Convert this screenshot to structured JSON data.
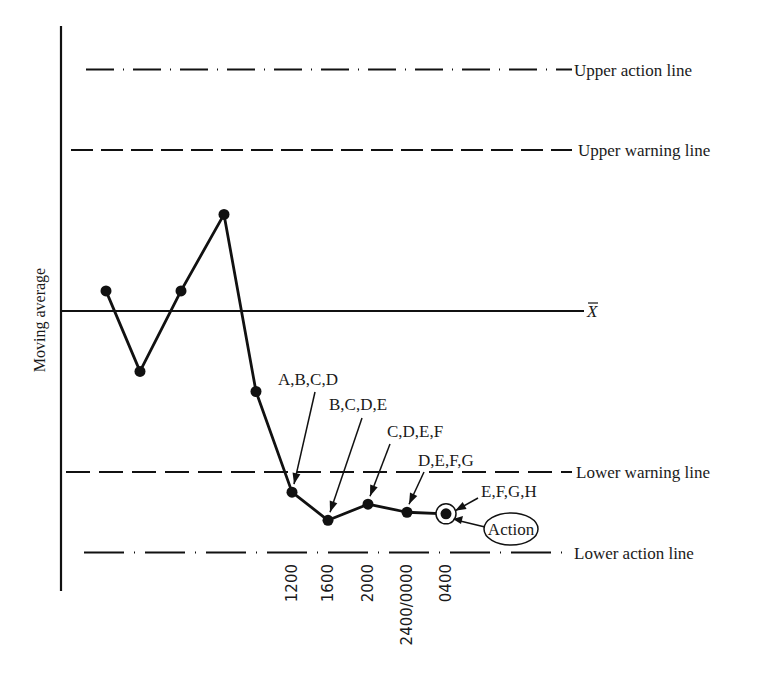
{
  "chart_data": {
    "type": "line",
    "title": "",
    "xlabel": "",
    "ylabel": "Moving average",
    "grid": false,
    "legend": "none",
    "ylim": [
      -3.3,
      3.3
    ],
    "x_tick_labels": [
      "1200",
      "1600",
      "2000",
      "2400/0000",
      "0400"
    ],
    "reference_lines": [
      {
        "name": "Upper action line",
        "value": 3.0,
        "style": "dash-dot"
      },
      {
        "name": "Upper warning line",
        "value": 2.0,
        "style": "dashed"
      },
      {
        "name": "X-bar",
        "label": "X",
        "overline": true,
        "value": 0.0,
        "style": "solid"
      },
      {
        "name": "Lower warning line",
        "value": -2.0,
        "style": "dashed"
      },
      {
        "name": "Lower action line",
        "value": -3.0,
        "style": "dash-dot"
      }
    ],
    "series": [
      {
        "name": "Moving average",
        "points": [
          {
            "x": 1,
            "y": 0.25
          },
          {
            "x": 2,
            "y": -0.75
          },
          {
            "x": 3,
            "y": 0.25
          },
          {
            "x": 4,
            "y": 1.2
          },
          {
            "x": 5,
            "y": -1.0
          },
          {
            "x": 6,
            "y": -2.25,
            "tick": "1200",
            "annotation": "A,B,C,D"
          },
          {
            "x": 7,
            "y": -2.6,
            "tick": "1600",
            "annotation": "B,C,D,E"
          },
          {
            "x": 8,
            "y": -2.4,
            "tick": "2000",
            "annotation": "C,D,E,F"
          },
          {
            "x": 9,
            "y": -2.5,
            "tick": "2400/0000",
            "annotation": "D,E,F,G"
          },
          {
            "x": 10,
            "y": -2.52,
            "tick": "0400",
            "annotation": "E,F,G,H",
            "circled": true
          }
        ]
      }
    ],
    "callout": {
      "label": "Action",
      "target_x": 10
    }
  }
}
